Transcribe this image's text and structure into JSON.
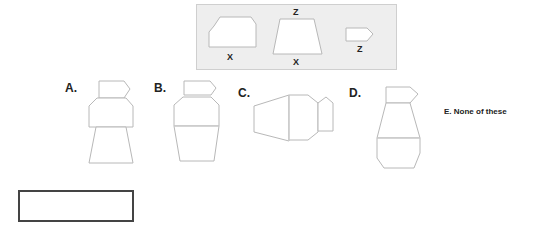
{
  "reference": {
    "shape1_label": "X",
    "shape2_top_label": "Z",
    "shape2_bottom_label": "X",
    "shape3_label": "Z"
  },
  "options": {
    "a": "A.",
    "b": "B.",
    "c": "C.",
    "d": "D.",
    "e": "E. None of these"
  },
  "answer_box": {
    "value": ""
  },
  "colors": {
    "reference_bg": "#eeeeee",
    "shape_stroke": "#bdbdbd",
    "answer_border": "#444444"
  }
}
